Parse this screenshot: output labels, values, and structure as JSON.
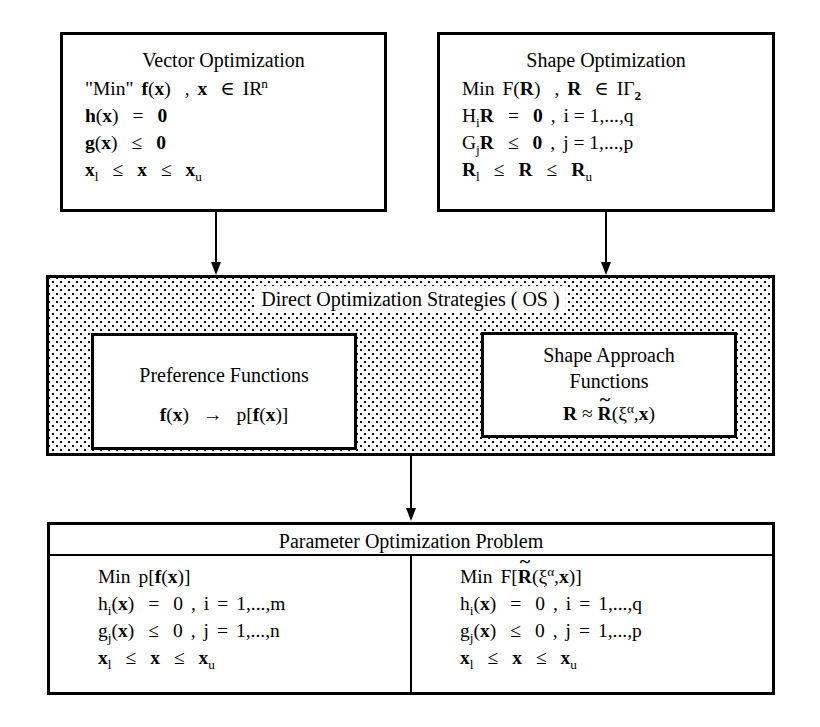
{
  "diagram": {
    "boxes": {
      "vector_optimization": {
        "title": "Vector Optimization",
        "lines": [
          "\"Min\"  f(x)  ,  x ∈ IRⁿ",
          "h(x)  =  0",
          "g(x)  ≤  0",
          "xₗ  ≤  x  ≤  xᵤ"
        ]
      },
      "shape_optimization": {
        "title": "Shape Optimization",
        "lines": [
          "Min  F(R)  ,  R ∈ IΓ₂",
          "HᵢR  =  0  ,  i = 1,...,q",
          "GⱼR  ≤  0  ,  j = 1,...,p",
          "Rₗ  ≤  R  ≤  Rᵤ"
        ]
      },
      "direct_optimization_strategies": {
        "title": "Direct Optimization Strategies ( OS )",
        "preference_functions": {
          "title": "Preference Functions",
          "formula": "f(x)  →  p[f(x)]"
        },
        "shape_approach_functions": {
          "title_line1": "Shape Approach",
          "title_line2": "Functions",
          "formula": "R ≈ R̃(ξᵅ,x)"
        }
      },
      "parameter_optimization_problem": {
        "title": "Parameter Optimization Problem",
        "left_column": [
          "Min  p[f(x)]",
          "hᵢ(x)  =  0  ,  i = 1,...,m",
          "gⱼ(x)  ≤  0  ,  j = 1,...,n",
          "xₗ  ≤  x  ≤  xᵤ"
        ],
        "right_column": [
          "Min  F[R̃(ξᵅ,x)]",
          "hᵢ(x)  =  0  ,  i = 1,...,q",
          "gⱼ(x)  ≤  0  ,  j = 1,...,p",
          "xₗ  ≤  x  ≤  xᵤ"
        ]
      }
    },
    "arrows": [
      {
        "name": "vector-to-strategies",
        "from": "vector_optimization",
        "to": "direct_optimization_strategies"
      },
      {
        "name": "shape-to-strategies",
        "from": "shape_optimization",
        "to": "direct_optimization_strategies"
      },
      {
        "name": "strategies-to-parameter",
        "from": "direct_optimization_strategies",
        "to": "parameter_optimization_problem"
      }
    ],
    "colors": {
      "stroke": "#000000",
      "fill": "#ffffff",
      "stipple": "#111111"
    }
  }
}
